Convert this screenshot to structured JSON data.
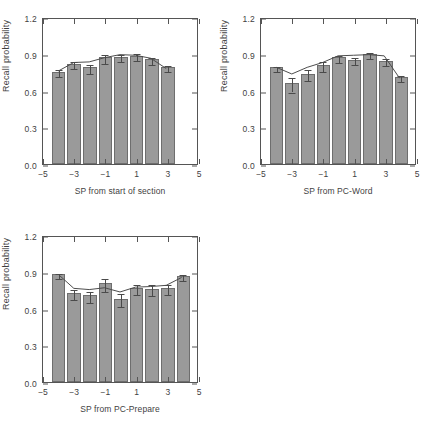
{
  "figure": {
    "title": "",
    "panel_count": 3,
    "bar_color": "#9a9a9a",
    "line_color": "#4a4a4a",
    "axis_color": "#555555"
  },
  "axes": {
    "ylabel": "Recall probability",
    "yticks": [
      "0.0",
      "0.3",
      "0.6",
      "0.9",
      "1.2"
    ],
    "ytick_values": [
      0.0,
      0.3,
      0.6,
      0.9,
      1.2
    ],
    "ylim": [
      0.0,
      1.2
    ],
    "xticks": [
      "−5",
      "−3",
      "−1",
      "1",
      "3",
      "5"
    ],
    "xtick_values": [
      -5,
      -3,
      -1,
      1,
      3,
      5
    ],
    "xlim": [
      -5,
      5
    ]
  },
  "chart_data": [
    {
      "type": "bar",
      "id": "panel-a",
      "title": "",
      "xlabel": "SP from start of section",
      "ylabel": "Recall probability",
      "categories": [
        -4,
        -3,
        -2,
        -1,
        0,
        1,
        2,
        3
      ],
      "x": [
        -4,
        -3,
        -2,
        -1,
        0,
        1,
        2,
        3
      ],
      "values": [
        0.755,
        0.82,
        0.79,
        0.87,
        0.875,
        0.885,
        0.855,
        0.79
      ],
      "errors": [
        0.025,
        0.03,
        0.035,
        0.035,
        0.03,
        0.028,
        0.03,
        0.025
      ],
      "series": [
        {
          "name": "observed",
          "type": "bar",
          "values": [
            0.755,
            0.82,
            0.79,
            0.87,
            0.875,
            0.885,
            0.855,
            0.79
          ]
        },
        {
          "name": "model",
          "type": "line",
          "values": [
            0.77,
            0.84,
            0.845,
            0.88,
            0.905,
            0.9,
            0.875,
            0.79
          ]
        }
      ],
      "ylim": [
        0.0,
        1.2
      ],
      "xlim": [
        -5,
        5
      ],
      "grid": false,
      "legend": "none"
    },
    {
      "type": "bar",
      "id": "panel-b",
      "title": "",
      "xlabel": "SP from PC-Word",
      "ylabel": "Recall probability",
      "categories": [
        -4,
        -3,
        -2,
        -1,
        0,
        1,
        2,
        3
      ],
      "x": [
        -4,
        -3,
        -2,
        -1,
        0,
        1,
        2,
        3
      ],
      "values": [
        0.79,
        0.66,
        0.735,
        0.805,
        0.87,
        0.85,
        0.898,
        0.845
      ],
      "errors": [
        0.02,
        0.06,
        0.045,
        0.04,
        0.03,
        0.028,
        0.028,
        0.03
      ],
      "series": [
        {
          "name": "observed",
          "type": "bar",
          "values": [
            0.79,
            0.66,
            0.735,
            0.805,
            0.87,
            0.85,
            0.898,
            0.845
          ]
        },
        {
          "name": "model",
          "type": "line",
          "values": [
            0.8,
            0.745,
            0.8,
            0.84,
            0.895,
            0.9,
            0.905,
            0.895
          ]
        }
      ],
      "ylim": [
        0.0,
        1.2
      ],
      "xlim": [
        -5,
        5
      ],
      "grid": false,
      "legend": "none",
      "extra_bar": {
        "x": 4,
        "value": 0.71,
        "error": 0.025
      }
    },
    {
      "type": "bar",
      "id": "panel-c",
      "title": "",
      "xlabel": "SP from PC-Prepare",
      "ylabel": "Recall probability",
      "categories": [
        -4,
        -3,
        -2,
        -1,
        0,
        1,
        2,
        3
      ],
      "x": [
        -4,
        -3,
        -2,
        -1,
        0,
        1,
        2,
        3
      ],
      "values": [
        0.88,
        0.725,
        0.71,
        0.805,
        0.68,
        0.765,
        0.76,
        0.77
      ],
      "errors": [
        0.022,
        0.04,
        0.045,
        0.05,
        0.055,
        0.04,
        0.045,
        0.04
      ],
      "series": [
        {
          "name": "observed",
          "type": "bar",
          "values": [
            0.88,
            0.725,
            0.71,
            0.805,
            0.68,
            0.765,
            0.76,
            0.77
          ]
        },
        {
          "name": "model",
          "type": "line",
          "values": [
            0.89,
            0.775,
            0.765,
            0.78,
            0.745,
            0.785,
            0.79,
            0.8
          ]
        }
      ],
      "ylim": [
        0.0,
        1.2
      ],
      "xlim": [
        -5,
        5
      ],
      "grid": false,
      "legend": "none",
      "extra_bar": {
        "x": 4,
        "value": 0.865,
        "error": 0.025
      }
    }
  ]
}
